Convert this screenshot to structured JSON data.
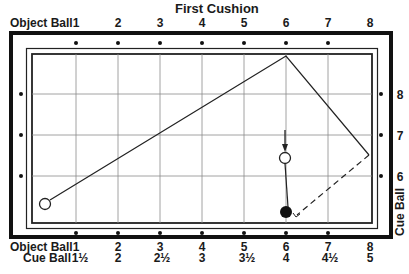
{
  "diagram": {
    "title": "First Cushion",
    "top_axis": {
      "label": "Object Ball",
      "ticks": [
        "1",
        "2",
        "3",
        "4",
        "5",
        "6",
        "7",
        "8"
      ]
    },
    "bottom_axis": {
      "object_ball_label": "Object Ball",
      "object_ball_ticks": [
        "1",
        "2",
        "3",
        "4",
        "5",
        "6",
        "7",
        "8"
      ],
      "cue_ball_label": "Cue Ball",
      "cue_ball_ticks": [
        "1½",
        "2",
        "2½",
        "3",
        "3½",
        "4",
        "4½",
        "5"
      ]
    },
    "right_axis": {
      "label": "Cue Ball",
      "ticks": [
        "8",
        "7",
        "6"
      ]
    },
    "elements": {
      "object_ball": "open circle at lower-left corner region",
      "cue_ball_ghost": "open circle below arrow near diamond 6",
      "cue_ball": "solid black ball on bottom rail near diamond 6",
      "path": "object ball travels to first cushion at diamond 6 (top rail), then to right rail, then dashed back toward cue ball"
    },
    "colors": {
      "line": "#1a1a1a",
      "grid": "#8a8a8a",
      "background": "#ffffff"
    }
  }
}
